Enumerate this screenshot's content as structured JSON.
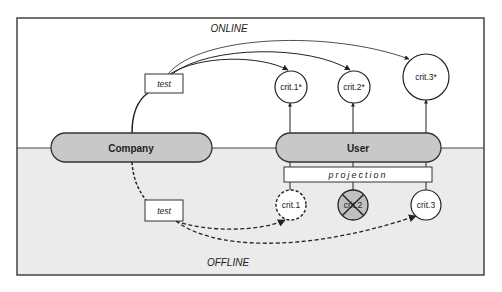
{
  "diagram": {
    "regions": {
      "online_label": "ONLINE",
      "offline_label": "OFFLINE"
    },
    "entities": {
      "company": "Company",
      "user": "User"
    },
    "test_boxes": {
      "online": "test",
      "offline": "test"
    },
    "projection": "projection",
    "online_criteria": [
      {
        "label": "crit.1*"
      },
      {
        "label": "crit.2*"
      },
      {
        "label": "crit.3*"
      }
    ],
    "offline_criteria": [
      {
        "label": "crit.1",
        "style": "dashed"
      },
      {
        "label": "crit.2",
        "style": "crossed-out"
      },
      {
        "label": "crit.3",
        "style": "solid"
      }
    ],
    "colors": {
      "online_bg": "#ffffff",
      "offline_bg": "#ebebeb",
      "pill_fill": "#c8c8c8",
      "stroke": "#333333",
      "crossed_fill": "#c0c0c0"
    }
  }
}
